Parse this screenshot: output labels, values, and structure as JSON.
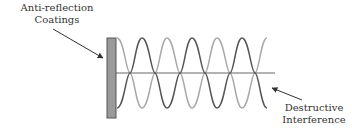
{
  "labels": {
    "coating_line1": "Anti-reflection",
    "coating_line2": "Coatings",
    "destructive_line1": "Destructive",
    "destructive_line2": "Interference"
  },
  "colors": {
    "background": "#ffffff",
    "coating_fill": "#9a9a9a",
    "coating_stroke": "#555555",
    "wave_dark": "#555555",
    "wave_light": "#a8a8a8",
    "axis": "#666666",
    "arrow": "#333333",
    "text": "#333333"
  }
}
